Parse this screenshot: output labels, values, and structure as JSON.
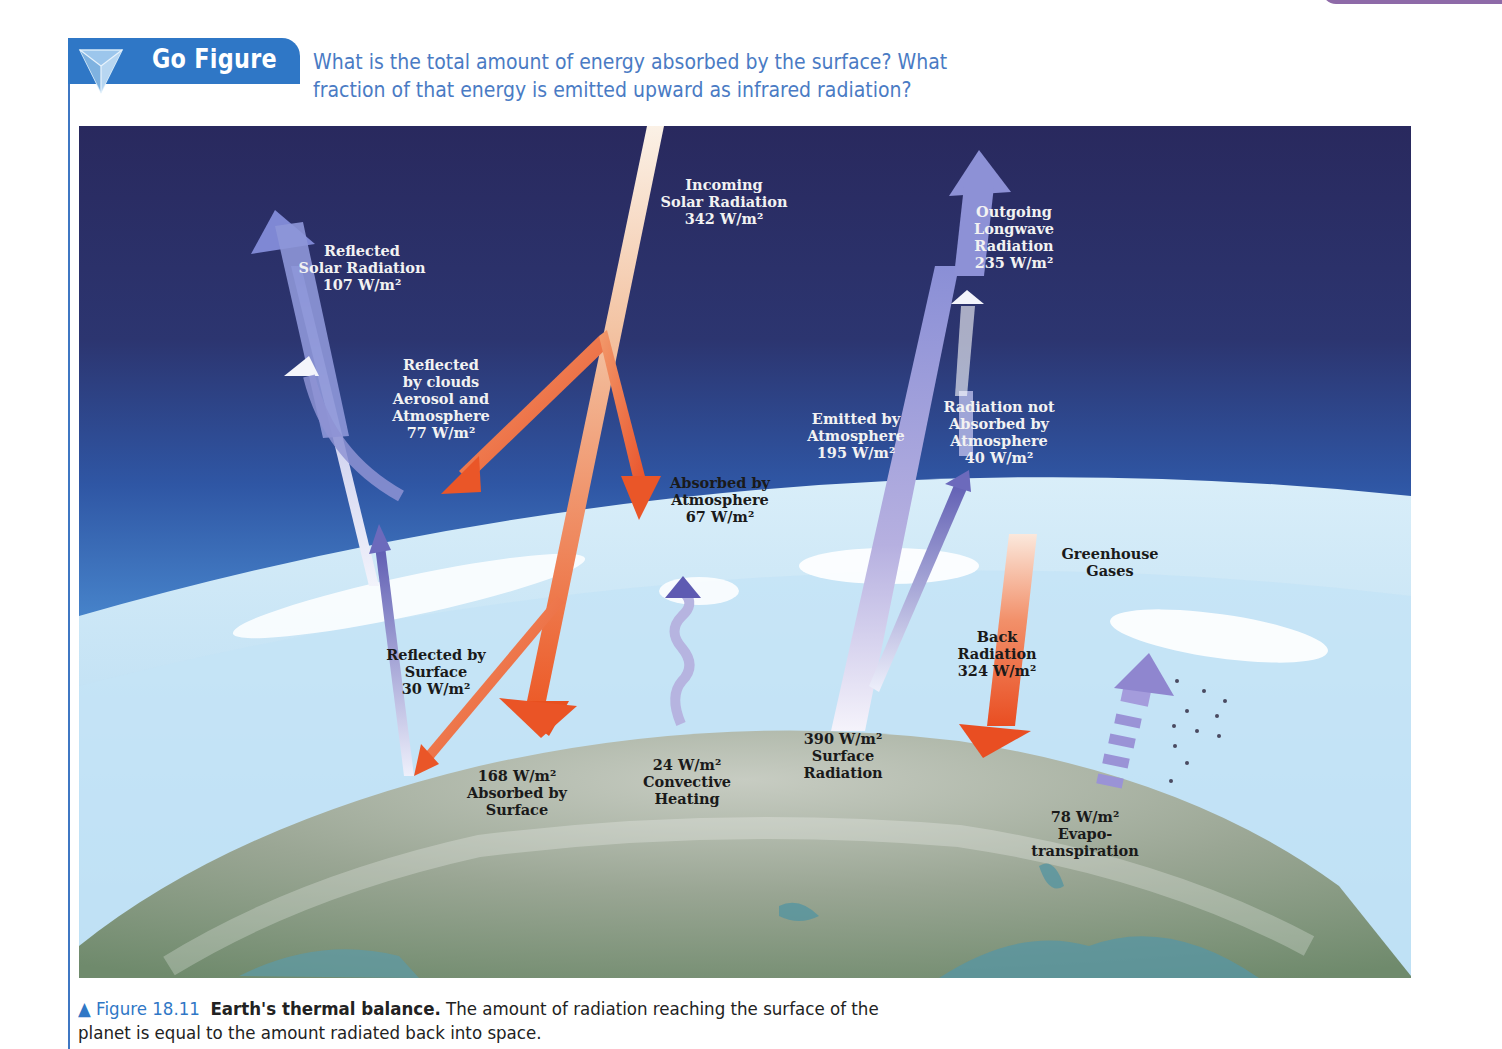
{
  "header": {
    "badge_label": "Go Figure",
    "badge_icon": "triangle-pyramid-icon",
    "question": "What is the total amount of energy absorbed by the surface? What fraction of that energy is emitted upward as infrared radiation?"
  },
  "diagram": {
    "labels": {
      "incoming_solar": [
        "Incoming",
        "Solar Radiation",
        "342 W/m²"
      ],
      "reflected_solar": [
        "Reflected",
        "Solar Radiation",
        "107 W/m²"
      ],
      "reflected_clouds": [
        "Reflected",
        "by clouds",
        "Aerosol and",
        "Atmosphere",
        "77 W/m²"
      ],
      "absorbed_atmosphere": [
        "Absorbed by",
        "Atmosphere",
        "67 W/m²"
      ],
      "outgoing_longwave": [
        "Outgoing",
        "Longwave",
        "Radiation",
        "235 W/m²"
      ],
      "emitted_atmosphere": [
        "Emitted by",
        "Atmosphere",
        "195 W/m²"
      ],
      "not_absorbed": [
        "Radiation not",
        "Absorbed by",
        "Atmosphere",
        "40 W/m²"
      ],
      "greenhouse": [
        "Greenhouse",
        "Gases"
      ],
      "reflected_surface": [
        "Reflected by",
        "Surface",
        "30 W/m²"
      ],
      "back_radiation": [
        "Back",
        "Radiation",
        "324 W/m²"
      ],
      "absorbed_surface": [
        "168 W/m²",
        "Absorbed by",
        "Surface"
      ],
      "convective": [
        "24 W/m²",
        "Convective",
        "Heating"
      ],
      "surface_radiation": [
        "390 W/m²",
        "Surface",
        "Radiation"
      ],
      "evapotranspiration": [
        "78 W/m²",
        "Evapo-",
        "transpiration"
      ]
    },
    "flows_w_m2": {
      "incoming_solar": 342,
      "reflected_solar_total": 107,
      "reflected_clouds_aerosol_atmosphere": 77,
      "reflected_surface": 30,
      "absorbed_atmosphere": 67,
      "absorbed_surface": 168,
      "outgoing_longwave": 235,
      "emitted_atmosphere": 195,
      "not_absorbed_atmosphere": 40,
      "back_radiation": 324,
      "surface_radiation": 390,
      "convective_heating": 24,
      "evapotranspiration": 78
    },
    "colors": {
      "space_top": "#2a2d62",
      "sky_mid": "#3f74c0",
      "atmosphere": "#bfe0f3",
      "earth": "#a9b3a4",
      "shortwave_arrow": "#ee6a3c",
      "longwave_arrow": "#8f8fd4"
    }
  },
  "caption": {
    "figure_number": "▲ Figure 18.11",
    "figure_title": "Earth's thermal balance.",
    "text": "The amount of radiation reaching the surface of the planet is equal to the amount radiated back into space."
  }
}
